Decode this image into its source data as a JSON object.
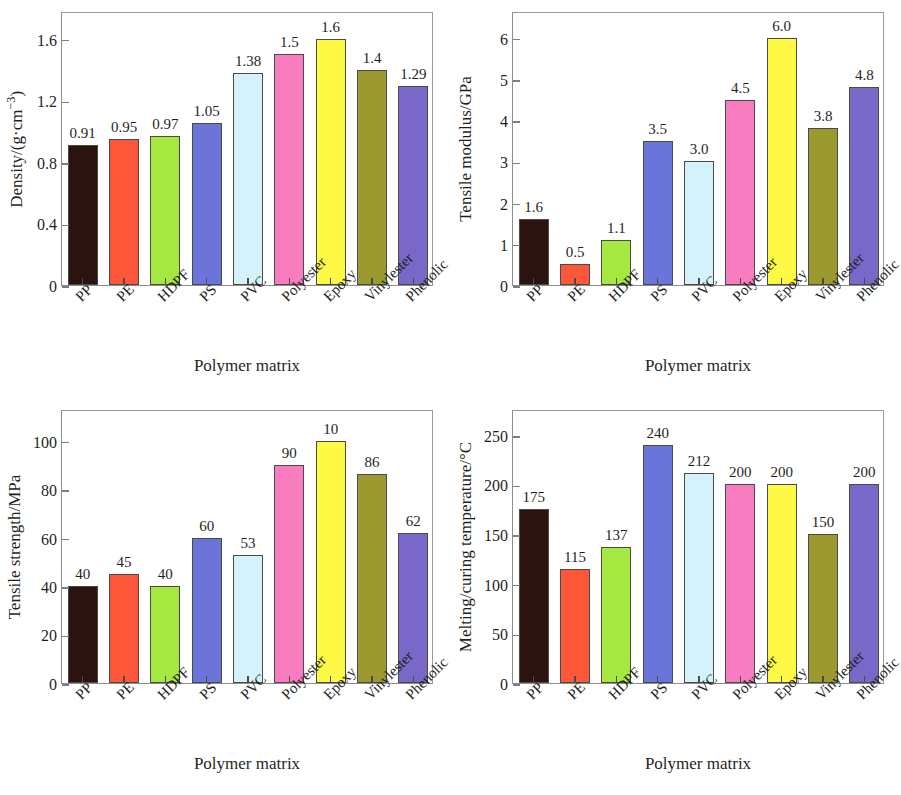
{
  "figure": {
    "background": "#ffffff",
    "panel_count": 4,
    "shared_xlabel": "Polymer matrix",
    "categories": [
      "PP",
      "PE",
      "HDPF",
      "PS",
      "PVC",
      "Polyester",
      "Epoxy",
      "Vinylester",
      "Phenolic"
    ],
    "bar_colors": [
      "#2b1410",
      "#fb5738",
      "#a5e840",
      "#6b74d8",
      "#d4f2f9",
      "#f87cc0",
      "#fdf944",
      "#9a9a2e",
      "#7a68c8"
    ],
    "bar_edge_color": "#4a4a4a",
    "axis_color": "#8d8d8d"
  },
  "chart_data": [
    {
      "type": "bar",
      "panel": "top-left",
      "title": "",
      "xlabel": "Polymer matrix",
      "ylabel": "Density/(g·cm⁻³)",
      "ylabel_html": "Density/(g·cm<sup>−3</sup>)",
      "categories": [
        "PP",
        "PE",
        "HDPF",
        "PS",
        "PVC",
        "Polyester",
        "Epoxy",
        "Vinylester",
        "Phenolic"
      ],
      "values": [
        0.91,
        0.95,
        0.97,
        1.05,
        1.38,
        1.5,
        1.6,
        1.4,
        1.29
      ],
      "value_labels": [
        "0.91",
        "0.95",
        "0.97",
        "1.05",
        "1.38",
        "1.5",
        "1.6",
        "1.4",
        "1.29"
      ],
      "yticks": [
        0,
        0.4,
        0.8,
        1.2,
        1.6
      ],
      "ytick_labels": [
        "0",
        "0.4",
        "0.8",
        "1.2",
        "1.6"
      ],
      "ylim": [
        0,
        1.78
      ],
      "grid": false,
      "legend": false
    },
    {
      "type": "bar",
      "panel": "top-right",
      "title": "",
      "xlabel": "Polymer matrix",
      "ylabel": "Tensile modulus/GPa",
      "ylabel_html": "Tensile modulus/GPa",
      "categories": [
        "PP",
        "PE",
        "HDPF",
        "PS",
        "PVC",
        "Polyester",
        "Epoxy",
        "Vinylester",
        "Phenolic"
      ],
      "values": [
        1.6,
        0.5,
        1.1,
        3.5,
        3.0,
        4.5,
        6.0,
        3.8,
        4.8
      ],
      "value_labels": [
        "1.6",
        "0.5",
        "1.1",
        "3.5",
        "3.0",
        "4.5",
        "6.0",
        "3.8",
        "4.8"
      ],
      "yticks": [
        0,
        1,
        2,
        3,
        4,
        5,
        6
      ],
      "ytick_labels": [
        "0",
        "1",
        "2",
        "3",
        "4",
        "5",
        "6"
      ],
      "ylim": [
        0,
        6.65
      ],
      "grid": false,
      "legend": false
    },
    {
      "type": "bar",
      "panel": "bottom-left",
      "title": "",
      "xlabel": "Polymer matrix",
      "ylabel": "Tensile strength/MPa",
      "ylabel_html": "Tensile strength/MPa",
      "categories": [
        "PP",
        "PE",
        "HDPF",
        "PS",
        "PVC",
        "Polyester",
        "Epoxy",
        "Vinylester",
        "Phenolic"
      ],
      "values": [
        40,
        45,
        40,
        60,
        53,
        90,
        100,
        86,
        62
      ],
      "value_labels": [
        "40",
        "45",
        "40",
        "60",
        "53",
        "90",
        "10",
        "86",
        "62"
      ],
      "yticks": [
        0,
        20,
        40,
        60,
        80,
        100
      ],
      "ytick_labels": [
        "0",
        "20",
        "40",
        "60",
        "80",
        "100"
      ],
      "ylim": [
        0,
        113
      ],
      "grid": false,
      "legend": false
    },
    {
      "type": "bar",
      "panel": "bottom-right",
      "title": "",
      "xlabel": "Polymer matrix",
      "ylabel": "Melting/curing temperature/°C",
      "ylabel_html": "Melting/curing temperature/°C",
      "categories": [
        "PP",
        "PE",
        "HDPF",
        "PS",
        "PVC",
        "Polyester",
        "Epoxy",
        "Vinylester",
        "Phenolic"
      ],
      "values": [
        175,
        115,
        137,
        240,
        212,
        200,
        200,
        150,
        200
      ],
      "value_labels": [
        "175",
        "115",
        "137",
        "240",
        "212",
        "200",
        "200",
        "150",
        "200"
      ],
      "yticks": [
        0,
        50,
        100,
        150,
        200,
        250
      ],
      "ytick_labels": [
        "0",
        "50",
        "100",
        "150",
        "200",
        "250"
      ],
      "ylim": [
        0,
        276
      ],
      "grid": false,
      "legend": false
    }
  ]
}
